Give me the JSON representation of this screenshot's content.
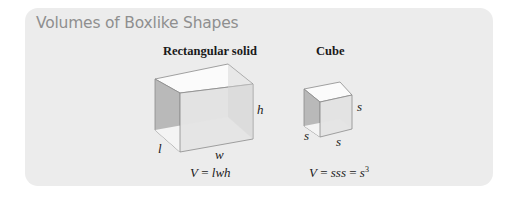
{
  "panel": {
    "title": "Volumes of Boxlike Shapes",
    "background": "#ececec"
  },
  "figures": [
    {
      "name": "Rectangular solid",
      "labels": {
        "length": "l",
        "width": "w",
        "height": "h"
      },
      "formula": {
        "lhs": "V",
        "rhs": "lwh",
        "text": "V = lwh"
      }
    },
    {
      "name": "Cube",
      "labels": {
        "side_left": "s",
        "side_bottom": "s",
        "side_right": "s"
      },
      "formula": {
        "lhs": "V",
        "rhs": "sss",
        "power_base": "s",
        "exponent": "3",
        "text": "V = sss = s3"
      }
    }
  ]
}
